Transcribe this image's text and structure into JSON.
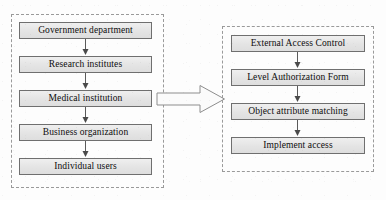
{
  "diagram": {
    "colors": {
      "box_fill": "#e6e6e6",
      "box_border": "#6f6f6f",
      "group_border": "#9a9a9a",
      "arrow_stroke": "#5a5a5a",
      "background": "#fdfdfd",
      "text": "#0d0d0d"
    },
    "left_group": {
      "name": "user-entities-group",
      "border_style": "dashed",
      "nodes": [
        {
          "id": "gov",
          "label": "Government department"
        },
        {
          "id": "research",
          "label": "Research institutes"
        },
        {
          "id": "medical",
          "label": "Medical institution"
        },
        {
          "id": "business",
          "label": "Business organization"
        },
        {
          "id": "individual",
          "label": "Individual users"
        }
      ],
      "connectors": [
        {
          "from": "gov",
          "to": "research",
          "direction": "down"
        },
        {
          "from": "research",
          "to": "medical",
          "direction": "down"
        },
        {
          "from": "medical",
          "to": "business",
          "direction": "down"
        },
        {
          "from": "business",
          "to": "individual",
          "direction": "down"
        }
      ]
    },
    "right_group": {
      "name": "access-control-process-group",
      "border_style": "dashed",
      "nodes": [
        {
          "id": "eac",
          "label": "External Access Control"
        },
        {
          "id": "laf",
          "label": "Level Authorization Form"
        },
        {
          "id": "oam",
          "label": "Object attribute matching"
        },
        {
          "id": "ia",
          "label": "Implement access"
        }
      ],
      "connectors": [
        {
          "from": "eac",
          "to": "laf",
          "direction": "down"
        },
        {
          "from": "laf",
          "to": "oam",
          "direction": "down"
        },
        {
          "from": "oam",
          "to": "ia",
          "direction": "down"
        }
      ]
    },
    "main_arrow": {
      "name": "block-arrow-right",
      "direction": "right",
      "from_group": "user-entities-group",
      "to_group": "access-control-process-group",
      "label": ""
    }
  }
}
